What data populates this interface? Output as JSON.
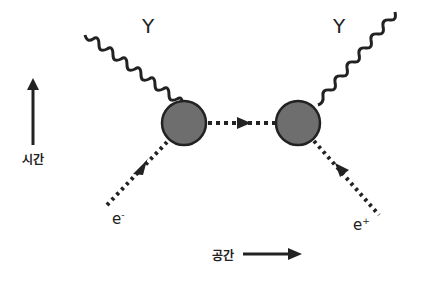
{
  "diagram": {
    "type": "feynman-diagram",
    "labels": {
      "photon_left": "Y",
      "photon_right": "Y",
      "electron_in": "e",
      "electron_in_charge": "-",
      "positron_out": "e",
      "positron_out_charge": "+",
      "time_axis": "시간",
      "space_axis": "공간"
    },
    "colors": {
      "vertex_fill": "#6e6e6e",
      "line": "#222222",
      "background": "#ffffff"
    }
  }
}
